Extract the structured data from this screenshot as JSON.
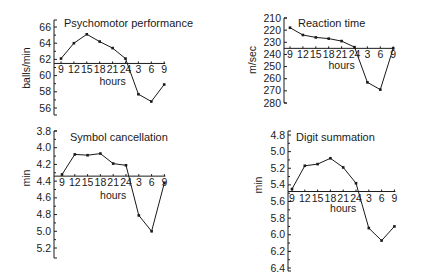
{
  "chart_data": [
    {
      "type": "line",
      "title": "Psychomotor performance",
      "xlabel": "hours",
      "ylabel": "balls/min",
      "categories": [
        "9",
        "12",
        "15",
        "18",
        "21",
        "24",
        "3",
        "6",
        "9"
      ],
      "values": [
        62.1,
        64.0,
        65.1,
        64.2,
        63.4,
        62.1,
        57.7,
        56.8,
        58.9
      ],
      "yticks": [
        "66",
        "64",
        "62",
        "60",
        "58",
        "56"
      ],
      "ylim": [
        55.5,
        66.8
      ],
      "y_inverted": false,
      "xaxis_at": 61.5,
      "grid": false
    },
    {
      "type": "line",
      "title": "Reaction time",
      "xlabel": "hours",
      "ylabel": "m/sec",
      "categories": [
        "9",
        "12",
        "15",
        "18",
        "21",
        "24",
        "3",
        "6",
        "9"
      ],
      "values": [
        218,
        224,
        226,
        227,
        229,
        234,
        263,
        269,
        235
      ],
      "yticks": [
        "210",
        "220",
        "230",
        "240",
        "250",
        "260",
        "270",
        "280"
      ],
      "ylim": [
        210,
        280
      ],
      "y_inverted": true,
      "xaxis_at": 235,
      "grid": false
    },
    {
      "type": "line",
      "title": "Symbol cancellation",
      "xlabel": "hours",
      "ylabel": "min",
      "categories": [
        "9",
        "12",
        "15",
        "18",
        "21",
        "24",
        "3",
        "6",
        "9"
      ],
      "values": [
        4.32,
        4.08,
        4.09,
        4.07,
        4.19,
        4.21,
        4.81,
        5.0,
        4.42
      ],
      "yticks": [
        "3.8",
        "4.0",
        "4.2",
        "4.4",
        "4.6",
        "4.8",
        "5.0",
        "5.2"
      ],
      "ylim": [
        3.8,
        5.3
      ],
      "y_inverted": true,
      "xaxis_at": 4.34,
      "grid": false
    },
    {
      "type": "line",
      "title": "Digit summation",
      "xlabel": "hours",
      "ylabel": "min",
      "categories": [
        "9",
        "12",
        "15",
        "18",
        "21",
        "24",
        "3",
        "6",
        "9"
      ],
      "values": [
        5.45,
        5.17,
        5.15,
        5.08,
        5.19,
        5.38,
        5.92,
        6.07,
        5.9
      ],
      "yticks": [
        "4.8",
        "5.0",
        "5.2",
        "5.4",
        "5.6",
        "5.8",
        "6.0",
        "6.2",
        "6.4"
      ],
      "ylim": [
        4.8,
        6.4
      ],
      "y_inverted": true,
      "xaxis_at": 5.48,
      "grid": false
    }
  ],
  "layout": [
    {
      "axis_x": 54,
      "y_top": 20,
      "y_bottom": 115,
      "tick_first_y": 27,
      "tick_last_y": 108,
      "x_first": 61,
      "x_step": 12.9,
      "title_x": 64,
      "title_y": 27,
      "unit_x": 30,
      "unit_y": 68,
      "hours_y": 85,
      "xlab_dy": 10,
      "minor": true
    },
    {
      "axis_x": 284,
      "y_top": 18,
      "y_bottom": 103,
      "tick_first_y": 18,
      "tick_last_y": 103,
      "x_first": 290,
      "x_step": 12.9,
      "title_x": 298,
      "title_y": 27,
      "unit_x": 256,
      "unit_y": 60,
      "hours_y": 69,
      "xlab_dy": 10,
      "minor": false
    },
    {
      "axis_x": 54,
      "y_top": 131,
      "y_bottom": 258,
      "tick_first_y": 131,
      "tick_last_y": 248,
      "x_first": 62,
      "x_step": 12.8,
      "title_x": 70,
      "title_y": 141,
      "unit_x": 30,
      "unit_y": 178,
      "hours_y": 199,
      "xlab_dy": 10,
      "minor": true
    },
    {
      "axis_x": 288,
      "y_top": 131,
      "y_bottom": 271,
      "tick_first_y": 135,
      "tick_last_y": 268,
      "x_first": 292,
      "x_step": 12.8,
      "title_x": 296,
      "title_y": 141,
      "unit_x": 262,
      "unit_y": 185,
      "hours_y": 212,
      "xlab_dy": 10,
      "minor": true
    }
  ]
}
